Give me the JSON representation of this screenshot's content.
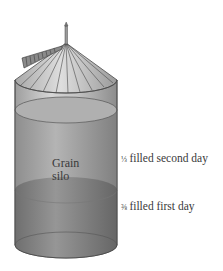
{
  "figure": {
    "silo_label_line1": "Grain",
    "silo_label_line2": "silo",
    "annotations": [
      {
        "fraction": "⅓",
        "text": "filled second day"
      },
      {
        "fraction": "⅜",
        "text": "filled first day"
      }
    ],
    "colors": {
      "background": "#ffffff",
      "silo_body": "#cfcfcf",
      "second_day_fill": "#a9a9a9",
      "first_day_fill": "#8a8a8a",
      "roof": "#bdbdbd",
      "outline": "#4a4a4a"
    }
  }
}
